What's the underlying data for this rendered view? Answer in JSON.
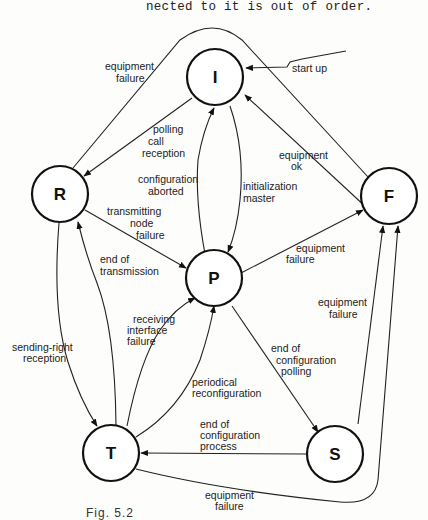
{
  "header_text": "nected to it is out of order.",
  "caption": "Fig. 5.2",
  "nodes": [
    {
      "id": "I",
      "label": "I"
    },
    {
      "id": "R",
      "label": "R"
    },
    {
      "id": "F",
      "label": "F"
    },
    {
      "id": "P",
      "label": "P"
    },
    {
      "id": "T",
      "label": "T"
    },
    {
      "id": "S",
      "label": "S"
    }
  ],
  "edges": [
    {
      "id": "startup",
      "from": null,
      "to": "I",
      "label": [
        "start up"
      ]
    },
    {
      "id": "R_F_equip",
      "from": "R",
      "to": "F",
      "label": [
        "equipment",
        "failure"
      ]
    },
    {
      "id": "I_R_polling",
      "from": "I",
      "to": "R",
      "label": [
        "polling",
        "call",
        "reception"
      ]
    },
    {
      "id": "P_I_aborted",
      "from": "P",
      "to": "I",
      "label": [
        "configuration",
        "aborted"
      ]
    },
    {
      "id": "I_P_initmaster",
      "from": "I",
      "to": "P",
      "label": [
        "initialization",
        "master"
      ]
    },
    {
      "id": "F_I_ok",
      "from": "F",
      "to": "I",
      "label": [
        "equipment",
        "ok"
      ]
    },
    {
      "id": "R_P_tnf",
      "from": "R",
      "to": "P",
      "label": [
        "transmitting",
        "node",
        "failure"
      ]
    },
    {
      "id": "P_F_equip",
      "from": "P",
      "to": "F",
      "label": [
        "equipment",
        "failure"
      ]
    },
    {
      "id": "T_R_eot",
      "from": "T",
      "to": "R",
      "label": [
        "end of",
        "transmission"
      ]
    },
    {
      "id": "R_T_sendright",
      "from": "R",
      "to": "T",
      "label": [
        "sending-right",
        "reception"
      ]
    },
    {
      "id": "T_P_recv",
      "from": "T",
      "to": "P",
      "label": [
        "receiving",
        "interface",
        "failure"
      ]
    },
    {
      "id": "T_P_periodic",
      "from": "T",
      "to": "P",
      "label": [
        "periodical",
        "reconfiguration"
      ]
    },
    {
      "id": "P_S_polling",
      "from": "P",
      "to": "S",
      "label": [
        "end of",
        "configuration",
        "polling"
      ]
    },
    {
      "id": "S_F_equip",
      "from": "S",
      "to": "F",
      "label": [
        "equipment",
        "failure"
      ]
    },
    {
      "id": "S_T_endproc",
      "from": "S",
      "to": "T",
      "label": [
        "end of",
        "configuration",
        "process"
      ]
    },
    {
      "id": "T_F_equip",
      "from": "T",
      "to": "F",
      "label": [
        "equipment",
        "failure"
      ]
    }
  ]
}
